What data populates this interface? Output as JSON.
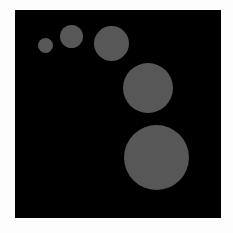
{
  "canvas": {
    "background": "#000000",
    "page_background": "#fdfdfd"
  },
  "circles": [
    {
      "cx": 45,
      "cy": 45,
      "d": 15,
      "color": "#575757"
    },
    {
      "cx": 71,
      "cy": 36,
      "d": 23,
      "color": "#575757"
    },
    {
      "cx": 111,
      "cy": 43,
      "d": 35,
      "color": "#575757"
    },
    {
      "cx": 148,
      "cy": 88,
      "d": 50,
      "color": "#575757"
    },
    {
      "cx": 156,
      "cy": 157,
      "d": 65,
      "color": "#575757"
    }
  ]
}
